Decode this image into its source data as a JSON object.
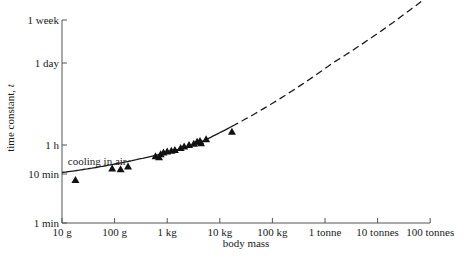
{
  "chart_data": {
    "type": "scatter",
    "title": "",
    "xlabel": "body mass",
    "ylabel": "time constant, t",
    "ylabel_italic_part": "t",
    "x_scale": "log",
    "y_scale": "log",
    "x_ticks": [
      {
        "label": "10 g",
        "value_kg": 0.01
      },
      {
        "label": "100 g",
        "value_kg": 0.1
      },
      {
        "label": "1 kg",
        "value_kg": 1
      },
      {
        "label": "10 kg",
        "value_kg": 10
      },
      {
        "label": "100 kg",
        "value_kg": 100
      },
      {
        "label": "1 tonne",
        "value_kg": 1000
      },
      {
        "label": "10 tonnes",
        "value_kg": 10000
      },
      {
        "label": "100 tonnes",
        "value_kg": 100000
      }
    ],
    "y_ticks": [
      {
        "label": "1 min",
        "value_min": 1
      },
      {
        "label": "10 min",
        "value_min": 10
      },
      {
        "label": "1 h",
        "value_min": 60
      },
      {
        "label": "1 day",
        "value_min": 1440
      },
      {
        "label": "1 week",
        "value_min": 10080
      }
    ],
    "xlim_kg": [
      0.01,
      100000
    ],
    "ylim_min": [
      1,
      10080
    ],
    "grid": false,
    "legend": null,
    "annotations": [
      {
        "text": "cooling in air",
        "x_kg": 0.02,
        "y_min": 22
      }
    ],
    "series": [
      {
        "name": "cooling in air (measured)",
        "marker": "triangle",
        "points_kg_min": [
          [
            0.018,
            7.5
          ],
          [
            0.09,
            14
          ],
          [
            0.13,
            13.5
          ],
          [
            0.18,
            16
          ],
          [
            0.6,
            30
          ],
          [
            0.7,
            28
          ],
          [
            0.75,
            34
          ],
          [
            0.85,
            38
          ],
          [
            1.0,
            40
          ],
          [
            1.2,
            42
          ],
          [
            1.4,
            44
          ],
          [
            1.8,
            50
          ],
          [
            2.1,
            55
          ],
          [
            2.6,
            60
          ],
          [
            3.2,
            63
          ],
          [
            3.7,
            68
          ],
          [
            4.2,
            70
          ],
          [
            4.4,
            64
          ],
          [
            5.5,
            75
          ],
          [
            17,
            100
          ]
        ]
      },
      {
        "name": "fitted curve (solid)",
        "style": "solid",
        "x_range_kg": [
          0.01,
          17
        ]
      },
      {
        "name": "extrapolated curve (dashed)",
        "style": "dashed",
        "x_range_kg": [
          17,
          150000
        ]
      }
    ]
  }
}
